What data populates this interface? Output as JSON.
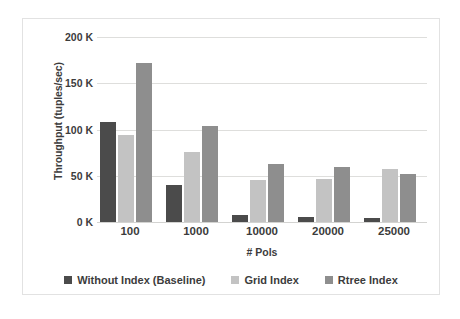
{
  "chart_data": {
    "type": "bar",
    "title": "",
    "xlabel": "# Pols",
    "ylabel": "Throughput (tuples/sec)",
    "categories": [
      "100",
      "1000",
      "10000",
      "20000",
      "25000"
    ],
    "series": [
      {
        "name": "Without Index (Baseline)",
        "color": "#4b4b4b",
        "values": [
          108,
          40,
          8,
          5,
          4
        ]
      },
      {
        "name": "Grid Index",
        "color": "#c3c3c3",
        "values": [
          94,
          76,
          45,
          46,
          57
        ]
      },
      {
        "name": "Rtree Index",
        "color": "#8e8e8e",
        "values": [
          172,
          104,
          63,
          59,
          52
        ]
      }
    ],
    "unit": "K tuples/sec",
    "ylim": [
      0,
      200
    ],
    "y_ticks": [
      0,
      50,
      100,
      150,
      200
    ],
    "y_tick_labels": [
      "0 K",
      "50 K",
      "100 K",
      "150 K",
      "200 K"
    ],
    "grid": true,
    "legend_position": "bottom"
  },
  "axes": {
    "y_title": "Throughput (tuples/sec)",
    "x_title": "# Pols",
    "y_ticks": [
      {
        "value": 200,
        "label": "200 K"
      },
      {
        "value": 150,
        "label": "150 K"
      },
      {
        "value": 100,
        "label": "100 K"
      },
      {
        "value": 50,
        "label": "50 K"
      },
      {
        "value": 0,
        "label": "0 K"
      }
    ],
    "x_ticks": [
      {
        "label": "100"
      },
      {
        "label": "1000"
      },
      {
        "label": "10000"
      },
      {
        "label": "20000"
      },
      {
        "label": "25000"
      }
    ]
  },
  "legend": {
    "items": [
      {
        "label": "Without Index (Baseline)",
        "color": "#4b4b4b"
      },
      {
        "label": "Grid Index",
        "color": "#c3c3c3"
      },
      {
        "label": "Rtree Index",
        "color": "#8e8e8e"
      }
    ]
  },
  "colors": {
    "baseline": "#4b4b4b",
    "grid_index": "#c3c3c3",
    "rtree_index": "#8e8e8e",
    "gridline": "#dededc",
    "text": "#3c3c3c",
    "frame": "#e2e2e2",
    "background": "#ffffff"
  }
}
